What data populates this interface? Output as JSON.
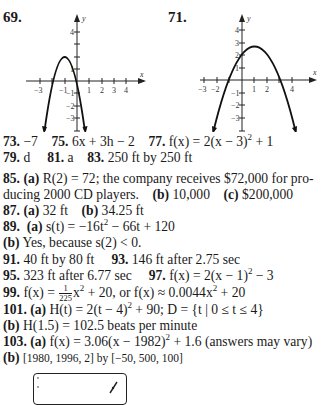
{
  "graph69": {
    "label": "69.",
    "x_ticks": [
      "−3",
      "−1",
      "1",
      "2",
      "3",
      "4"
    ],
    "y_ticks_pos": [
      "1",
      "4"
    ],
    "y_ticks_neg": [
      "−1",
      "−2",
      "−3"
    ],
    "axis_x": "x",
    "axis_y": "y"
  },
  "graph71": {
    "label": "71.",
    "x_ticks": [
      "−3",
      "−2",
      "1",
      "2",
      "4"
    ],
    "y_ticks_pos": [
      "1",
      "2",
      "3",
      "4"
    ],
    "y_ticks_neg": [
      "−1",
      "−2",
      "−3"
    ],
    "axis_x": "x",
    "axis_y": "y"
  },
  "answers": {
    "a73": {
      "num": "73.",
      "text": "−7"
    },
    "a75": {
      "num": "75.",
      "text": "6x + 3h − 2"
    },
    "a77": {
      "num": "77.",
      "pre": "f(x) = 2(x − 3)",
      "exp": "2",
      "post": " + 1"
    },
    "a79": {
      "num": "79.",
      "text": "d"
    },
    "a81": {
      "num": "81.",
      "text": "a"
    },
    "a83": {
      "num": "83.",
      "text": "250 ft by 250 ft"
    },
    "a85": {
      "num": "85.",
      "a_label": "(a)",
      "a_text": "R(2) = 72; the company receives $72,000 for pro-",
      "a_text2": "ducing 2000 CD players.",
      "b_label": "(b)",
      "b_text": "10,000",
      "c_label": "(c)",
      "c_text": "$200,000"
    },
    "a87": {
      "num": "87.",
      "a_label": "(a)",
      "a_text": "32 ft",
      "b_label": "(b)",
      "b_text": "34.25 ft"
    },
    "a89": {
      "num": "89.",
      "a_label": "(a)",
      "a_pre": "s(t) = −16t",
      "a_exp": "2",
      "a_post": " − 66t + 120",
      "b_label": "(b)",
      "b_text": "Yes, because s(2) < 0."
    },
    "a91": {
      "num": "91.",
      "text": "40 ft by 80 ft"
    },
    "a93": {
      "num": "93.",
      "text": "146 ft after 2.75 sec"
    },
    "a95": {
      "num": "95.",
      "text": "323 ft after 6.77 sec"
    },
    "a97": {
      "num": "97.",
      "pre": "f(x) = 2(x − 1)",
      "exp": "2",
      "post": " − 3"
    },
    "a99": {
      "num": "99.",
      "pre": "f(x) = ",
      "frac_num": "1",
      "frac_den": "225",
      "mid": "x",
      "exp": "2",
      "post": " + 20, or f(x) ≈ 0.0044x",
      "exp2": "2",
      "post2": " + 20"
    },
    "a101": {
      "num": "101.",
      "a_label": "(a)",
      "a_pre": "H(t) = 2(t − 4)",
      "a_exp": "2",
      "a_post": " + 90; D = {t | 0 ≤ t ≤ 4}",
      "b_label": "(b)",
      "b_text": "H(1.5) = 102.5 beats per minute"
    },
    "a103": {
      "num": "103.",
      "a_label": "(a)",
      "a_pre": "f(x) = 3.06(x − 1982)",
      "a_exp": "2",
      "a_post": " + 1.6 (answers may vary)",
      "b_label": "(b)",
      "b_text": "[1980, 1996, 2] by [−50, 500, 100]"
    }
  }
}
